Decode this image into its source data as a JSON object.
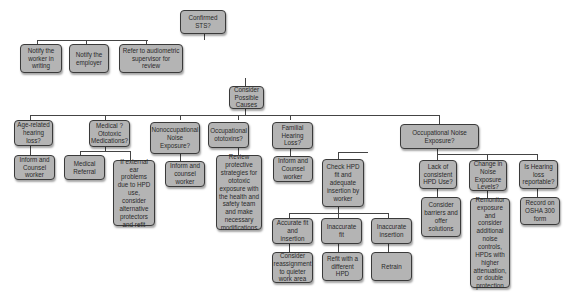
{
  "diagram": {
    "type": "flowchart",
    "root": "Confirmed STS?",
    "level1": {
      "notify_worker": "Notify the worker in writing",
      "notify_employer": "Notify the employer",
      "refer": "Refer to audiometric supervisor for review"
    },
    "consider": "Consider Possible Causes",
    "causes": [
      {
        "label": "Age-related hearing loss?",
        "actions": [
          "Inform and Counsel worker"
        ]
      },
      {
        "label": "Medical ? Ototoxic Medications?",
        "actions": [
          "Medical Referral",
          "If external ear problems due to HPD use, consider alternative protectors and refit"
        ]
      },
      {
        "label": "Nonoccupational Noise Exposure?",
        "actions": [
          "Inform and counsel worker"
        ]
      },
      {
        "label": "Occupational ototoxins?",
        "actions": [
          "Review protective strategies for ototoxic exposure with the health and safety team and make necessary modifications"
        ]
      },
      {
        "label": "Familial Hearing Loss?",
        "actions": [
          "Inform and Counsel worker"
        ]
      },
      {
        "label": "Occupational Noise Exposure?"
      }
    ],
    "noise": {
      "check": "Check HPD fit and adequate insertion by worker",
      "fit": [
        {
          "label": "Accurate fit and insertion",
          "action": "Consider reassignment to quieter work area"
        },
        {
          "label": "Inaccurate fit",
          "action": "Refit with a different HPD"
        },
        {
          "label": "Inaccurate insertion",
          "action": "Retrain"
        }
      ],
      "lack": {
        "label": "Lack of consistent HPD Use?",
        "action": "Consider barriers and offer solutions"
      },
      "change": {
        "label": "Change in Noise Exposure Levels?",
        "action": "Remonitor exposure and consider additional noise controls, HPDs with higher attenuation, or double protection"
      },
      "reportable": {
        "label": "Is Hearing loss reportable?",
        "action": "Record on OSHA 300 form"
      }
    }
  }
}
